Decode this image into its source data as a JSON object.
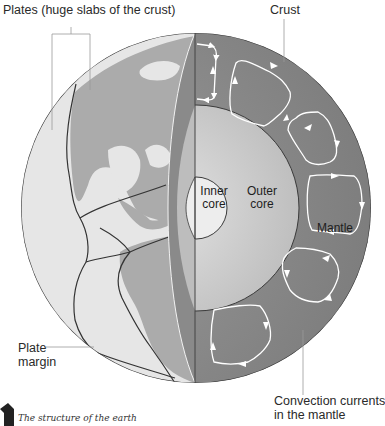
{
  "diagram": {
    "title": "The structure of the earth",
    "labels": {
      "plates": "Plates (huge slabs of the crust)",
      "crust": "Crust",
      "inner_core_line1": "Inner",
      "inner_core_line2": "core",
      "outer_core_line1": "Outer",
      "outer_core_line2": "core",
      "mantle": "Mantle",
      "plate_margin_line1": "Plate",
      "plate_margin_line2": "margin",
      "convection_line1": "Convection currents",
      "convection_line2": "in the mantle"
    },
    "caption": "The structure of the earth",
    "colors": {
      "ocean": "#e4e4e4",
      "land": "#a9a9a9",
      "mantle": "#8c8c8c",
      "mantle_dark": "#6f6f6f",
      "outer_core": "#cfcfcf",
      "inner_core": "#ececec",
      "plate_line": "#3a3a3a",
      "leader_line": "#9a9a9a",
      "arrow": "#ffffff"
    }
  }
}
